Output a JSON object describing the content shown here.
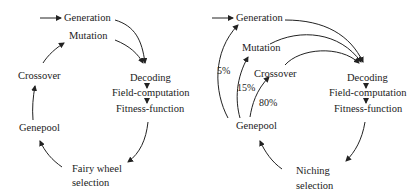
{
  "left": {
    "nodes": {
      "generation": "Generation",
      "mutation": "Mutation",
      "crossover": "Crossover",
      "decoding": "Decoding",
      "field_computation": "Field-computation",
      "fitness_function": "Fitness-function",
      "genepool": "Genepool",
      "selection_line1": "Fairy wheel",
      "selection_line2": "selection"
    }
  },
  "right": {
    "nodes": {
      "generation": "Generation",
      "mutation": "Mutation",
      "crossover": "Crossover",
      "decoding": "Decoding",
      "field_computation": "Field-computation",
      "fitness_function": "Fitness-function",
      "genepool": "Genepool",
      "selection_line1": "Niching",
      "selection_line2": "selection"
    },
    "probabilities": {
      "generation": "5%",
      "mutation": "15%",
      "crossover": "80%"
    }
  }
}
